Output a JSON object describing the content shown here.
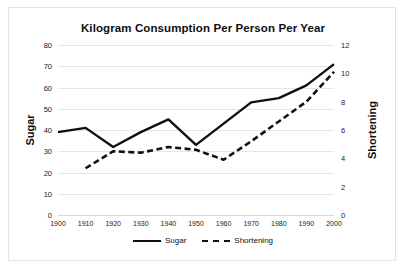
{
  "chart_data": {
    "type": "line",
    "title": "Kilogram Consumption Per Person Per Year",
    "xlabel": "",
    "ylabel": "Sugar",
    "y2label": "Shortening",
    "grid": true,
    "legend_position": "bottom",
    "x": [
      1900,
      1910,
      1920,
      1930,
      1940,
      1950,
      1960,
      1970,
      1980,
      1990,
      2000
    ],
    "xticklabels": [
      "1900",
      "1910",
      "1920",
      "1930",
      "1940",
      "1950",
      "1960",
      "1970",
      "1980",
      "1990",
      "2000"
    ],
    "ylim": [
      0,
      80
    ],
    "yticks": [
      0,
      10,
      20,
      30,
      40,
      50,
      60,
      70,
      80
    ],
    "yticklabels": [
      "0",
      "10",
      "20",
      "30",
      "40",
      "50",
      "60",
      "70",
      "80"
    ],
    "y2lim": [
      0,
      12
    ],
    "y2ticks": [
      0,
      2,
      4,
      6,
      8,
      10,
      12
    ],
    "y2ticklabels": [
      "0",
      "2",
      "4",
      "6",
      "8",
      "10",
      "12"
    ],
    "series": [
      {
        "name": "Sugar",
        "axis": "left",
        "style": "solid",
        "color": "#101010",
        "values": [
          39,
          41,
          32,
          39,
          45,
          33,
          43,
          53,
          55,
          61,
          71
        ]
      },
      {
        "name": "Shortening",
        "axis": "right",
        "style": "dashed",
        "color": "#101010",
        "values": [
          null,
          3.3,
          4.5,
          4.4,
          4.8,
          4.6,
          3.9,
          5.2,
          6.6,
          8.0,
          10.1
        ]
      }
    ]
  },
  "legend": {
    "items": [
      {
        "label": "Sugar",
        "style": "solid"
      },
      {
        "label": "Shortening",
        "style": "dashed"
      }
    ]
  }
}
